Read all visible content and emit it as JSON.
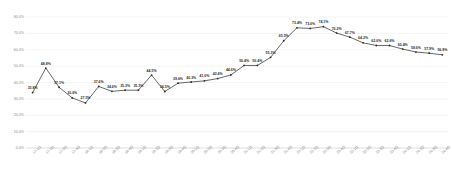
{
  "chart_data": {
    "type": "line",
    "title": "",
    "xlabel": "",
    "ylabel": "",
    "ylim": [
      0,
      80
    ],
    "ytick_labels": [
      "0.0%",
      "10.0%",
      "20.0%",
      "30.0%",
      "40.0%",
      "50.0%",
      "60.0%",
      "70.0%",
      "80.0%"
    ],
    "ytick_values": [
      0,
      10,
      20,
      30,
      40,
      50,
      60,
      70,
      80
    ],
    "grid": true,
    "legend": "none",
    "series_name": "rate",
    "line_color": "#404040",
    "marker_color": "#2b2b2b",
    "grid_color": "#e8e8e8",
    "categories": [
      "17-1Q",
      "17-2Q",
      "17-3Q",
      "17-4Q",
      "18-1Q",
      "18-2Q",
      "18-3Q",
      "18-4Q",
      "19-1Q",
      "19-2Q",
      "19-3Q",
      "19-4Q",
      "20-1Q",
      "20-2Q",
      "20-3Q",
      "20-4Q",
      "21-1Q",
      "21-2Q",
      "21-3Q",
      "21-4Q",
      "22-1Q",
      "22-2Q",
      "22-3Q",
      "22-4Q",
      "23-1Q",
      "23-2Q",
      "23-3Q",
      "23-4Q",
      "24-1Q",
      "24-2Q",
      "24-3Q",
      "24-4Q"
    ],
    "values": [
      33.8,
      48.8,
      37.1,
      30.6,
      27.5,
      37.6,
      34.6,
      35.3,
      35.3,
      44.5,
      34.5,
      39.6,
      40.3,
      41.0,
      42.4,
      44.6,
      50.4,
      50.4,
      55.3,
      65.5,
      73.4,
      73.0,
      74.1,
      70.2,
      67.7,
      64.2,
      62.6,
      62.6,
      60.4,
      58.6,
      57.9,
      56.9
    ],
    "value_labels": [
      "33.8%",
      "48.8%",
      "37.1%",
      "30.6%",
      "27.5%",
      "37.6%",
      "34.6%",
      "35.3%",
      "35.3%",
      "44.5%",
      "34.5%",
      "39.6%",
      "40.3%",
      "41.0%",
      "42.4%",
      "44.6%",
      "50.4%",
      "50.4%",
      "55.3%",
      "65.5%",
      "73.4%",
      "73.0%",
      "74.1%",
      "70.2%",
      "67.7%",
      "64.2%",
      "62.6%",
      "62.6%",
      "60.4%",
      "58.6%",
      "57.9%",
      "56.9%"
    ]
  }
}
